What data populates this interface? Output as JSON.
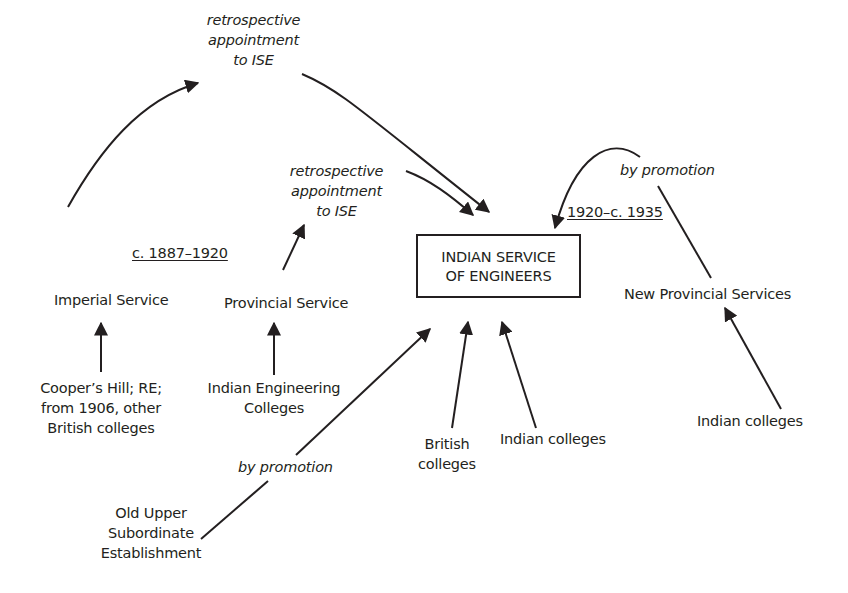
{
  "diagram": {
    "central_node": {
      "line1": "INDIAN SERVICE",
      "line2": "OF ENGINEERS"
    },
    "period_labels": {
      "early": "c. 1887–1920",
      "late": "1920–c. 1935"
    },
    "edge_labels": {
      "retro_imperial": [
        "retrospective",
        "appointment",
        "to ISE"
      ],
      "retro_provincial": [
        "retrospective",
        "appointment",
        "to ISE"
      ],
      "promotion_upper_subordinate": "by promotion",
      "promotion_new_provincial": "by promotion"
    },
    "nodes": {
      "imperial_service": "Imperial Service",
      "provincial_service": "Provincial Service",
      "new_provincial_services": "New Provincial Services",
      "coopers_hill": [
        "Cooper’s Hill; RE;",
        "from 1906, other",
        "British colleges"
      ],
      "indian_engineering_colleges": [
        "Indian Engineering",
        "Colleges"
      ],
      "british_colleges": [
        "British",
        "colleges"
      ],
      "indian_colleges_center": "Indian colleges",
      "indian_colleges_right": "Indian colleges",
      "old_upper_subordinate": [
        "Old Upper",
        "Subordinate",
        "Establishment"
      ]
    },
    "colors": {
      "ink": "#231f20",
      "background": "#ffffff"
    }
  }
}
